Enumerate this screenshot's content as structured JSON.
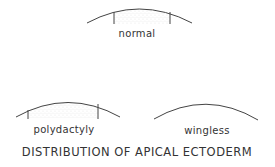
{
  "figure": {
    "title": "DISTRIBUTION OF APICAL ECTODERM",
    "panels": [
      {
        "id": "normal",
        "label": "normal",
        "ectoderm_extent": "middle",
        "stippled": true
      },
      {
        "id": "polydactyly",
        "label": "polydactyly",
        "ectoderm_extent": "extended",
        "stippled": true
      },
      {
        "id": "wingless",
        "label": "wingless",
        "ectoderm_extent": "none",
        "stippled": false
      }
    ]
  },
  "colors": {
    "line": "#444444",
    "text": "#333333",
    "stipple": "#9a9a9a",
    "background": "#ffffff"
  }
}
